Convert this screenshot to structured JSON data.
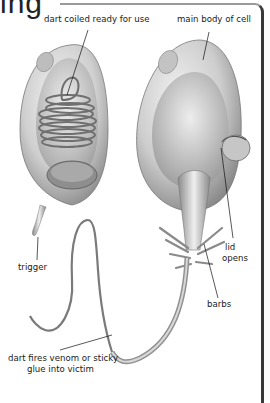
{
  "heading": {
    "fragment": "ing"
  },
  "diagram": {
    "labels": {
      "dart_coiled": "dart coiled ready for use",
      "main_body": "main body of cell",
      "trigger": "trigger",
      "lid_line1": "lid",
      "lid_line2": "opens",
      "barbs": "barbs",
      "dart_fires_line1": "dart fires venom or sticky",
      "dart_fires_line2": "glue into victim"
    }
  }
}
